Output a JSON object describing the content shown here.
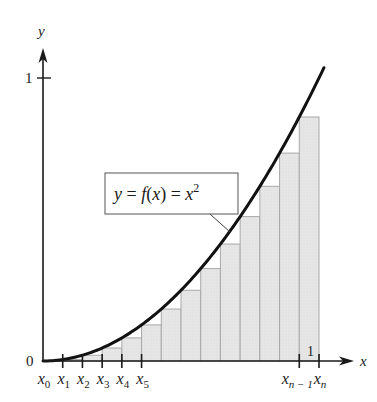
{
  "figure": {
    "type": "riemann-sum-lower-rectangles",
    "function_label": "y = f(x) = x²",
    "function_label_parts": {
      "lhs": "y = f(x) = x",
      "exponent": "2"
    },
    "axes": {
      "x_label": "x",
      "y_label": "y",
      "origin_label": "0",
      "y_tick_label": "1",
      "x_tick_label": "1"
    },
    "partition": {
      "n_subintervals": 14,
      "left_labels": [
        {
          "base": "x",
          "sub": "0"
        },
        {
          "base": "x",
          "sub": "1"
        },
        {
          "base": "x",
          "sub": "2"
        },
        {
          "base": "x",
          "sub": "3"
        },
        {
          "base": "x",
          "sub": "4"
        },
        {
          "base": "x",
          "sub": "5"
        }
      ],
      "right_labels": [
        {
          "base": "x",
          "sub": "n − 1"
        },
        {
          "base": "x",
          "sub": "n"
        }
      ]
    },
    "colors": {
      "curve": "#111111",
      "axis": "#1a1a1a",
      "rect_fill": "#e4e4e4",
      "rect_stroke": "#a8a8a8",
      "label_box_stroke": "#555555"
    }
  }
}
